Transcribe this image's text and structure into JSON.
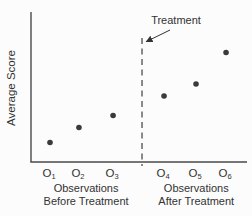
{
  "figure": {
    "background": "#fcfcfc"
  },
  "chart_data": {
    "type": "scatter",
    "title": "",
    "xlabel": "",
    "ylabel": "Average Score",
    "categories": [
      "O1",
      "O2",
      "O3",
      "O4",
      "O5",
      "O6"
    ],
    "category_labels": [
      {
        "base": "O",
        "sub": "1"
      },
      {
        "base": "O",
        "sub": "2"
      },
      {
        "base": "O",
        "sub": "3"
      },
      {
        "base": "O",
        "sub": "4"
      },
      {
        "base": "O",
        "sub": "5"
      },
      {
        "base": "O",
        "sub": "6"
      }
    ],
    "values": [
      1.3,
      2.3,
      3.1,
      4.4,
      5.2,
      7.3
    ],
    "ylim": [
      0,
      10
    ],
    "x_fractions": [
      0.088,
      0.222,
      0.38,
      0.616,
      0.764,
      0.903
    ],
    "grid": false,
    "legend": false,
    "treatment_line": {
      "label": "Treatment",
      "x_fraction": 0.514,
      "style": "dashed"
    },
    "groups": [
      {
        "label_line1": "Observations",
        "label_line2": "Before Treatment",
        "categories": [
          "O1",
          "O2",
          "O3"
        ],
        "center_fraction": 0.255
      },
      {
        "label_line1": "Observations",
        "label_line2": "After Treatment",
        "categories": [
          "O4",
          "O5",
          "O6"
        ],
        "center_fraction": 0.765
      }
    ],
    "colors": {
      "point": "#3a3a3a",
      "axis": "#4a4a4a",
      "dashed_line": "#5a5a5a",
      "text": "#333333"
    }
  }
}
